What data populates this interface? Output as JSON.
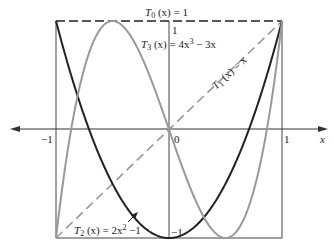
{
  "chart_data": {
    "type": "line",
    "title": "",
    "xlabel": "x",
    "ylabel": "",
    "xlim": [
      -1,
      1
    ],
    "ylim": [
      -1,
      1
    ],
    "grid": false,
    "x_ticks": [
      "-1",
      "0",
      "1"
    ],
    "y_ticks": [
      "1",
      "-1"
    ],
    "series": [
      {
        "name": "T0",
        "label_main": "T",
        "label_sub": "0",
        "label_rest": " (x) = 1",
        "formula": "1",
        "style": "dashed",
        "color": "#222222"
      },
      {
        "name": "T1",
        "label_main": "T",
        "label_sub": "1",
        "label_rest": " (x) = x",
        "formula": "x",
        "style": "dashed",
        "color": "#999999"
      },
      {
        "name": "T2",
        "label_main": "T",
        "label_sub": "2",
        "label_rest": " (x) = 2x² −1",
        "formula": "2x^2-1",
        "style": "solid",
        "color": "#222222"
      },
      {
        "name": "T3",
        "label_main": "T",
        "label_sub": "3",
        "label_rest": " (x) = 4x³ − 3x",
        "formula": "4x^3-3x",
        "style": "solid",
        "color": "#999999"
      }
    ]
  },
  "labels": {
    "x_axis": "x",
    "tick_neg1": "−1",
    "tick_0": "0",
    "tick_1": "1",
    "y_tick_top": "1",
    "y_tick_bottom": "−1",
    "t0_main": "T",
    "t0_sub": "0",
    "t0_rest": " (x) = 1",
    "t1_main": "T",
    "t1_sub": "1",
    "t1_rest": " (x) = x",
    "t2_main": "T",
    "t2_sub": "2",
    "t2_rest": " (x) = 2x",
    "t2_sup": "2",
    "t2_end": " −1",
    "t3_main": "T",
    "t3_sub": "3",
    "t3_rest": " (x) = 4x",
    "t3_sup": "3",
    "t3_end": " − 3x"
  }
}
